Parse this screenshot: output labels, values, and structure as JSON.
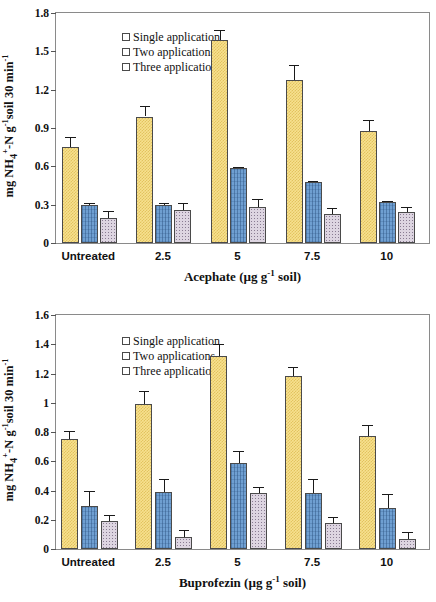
{
  "figure": {
    "panels": [
      {
        "letter": "a",
        "ylabel_html": "mg NH<sub>4</sub><sup>+</sup>-N g<sup>-1</sup>soil 30 min<sup>-1</sup>",
        "ylabel_plain": "mg NH4+-N g-1soil 30 min-1",
        "xlabel_plain": "Acephate (µg g-1 soil)"
      },
      {
        "letter": "b",
        "ylabel_plain": "mg NH4+-N g-1soil 30 min-1",
        "xlabel_plain": "Buprofezin (µg g-1 soil)"
      }
    ],
    "legend": {
      "items": [
        {
          "label": "Single application",
          "color": "#f7e08f"
        },
        {
          "label": "Two applications",
          "color": "#6f9fd1"
        },
        {
          "label": "Three applications",
          "color": "#ddd5e1"
        }
      ]
    },
    "axis_titles": {
      "y_prefix": "mg NH",
      "y_sub": "4",
      "y_sup_plus": "+",
      "y_mid": "-N g",
      "y_sup_neg1": "-1",
      "y_tail": "soil 30 min",
      "y_sup_neg1b": "-1",
      "x_unit_open": " (µg g",
      "x_unit_sup": "-1",
      "x_unit_close": " soil)",
      "x_a_name": "Acephate",
      "x_b_name": "Buprofezin"
    }
  },
  "chart_data": [
    {
      "type": "bar",
      "id": "panel-a",
      "panel_label": "a",
      "title": "",
      "xlabel": "Acephate (µg g-1 soil)",
      "ylabel": "mg NH4+-N g-1 soil 30 min-1",
      "categories": [
        "Untreated",
        "2.5",
        "5",
        "7.5",
        "10"
      ],
      "ylim": [
        0,
        1.8
      ],
      "yticks": [
        0,
        0.3,
        0.6,
        0.9,
        1.2,
        1.5,
        1.8
      ],
      "ytick_labels": [
        "0",
        "0.3",
        "0.6",
        "0.9",
        "1.2",
        "1.5",
        "1.8"
      ],
      "grid": false,
      "legend_position": "top-left",
      "series": [
        {
          "name": "Single application",
          "color": "#f7e08f",
          "values": [
            0.75,
            0.99,
            1.59,
            1.275,
            0.875
          ],
          "errors": [
            0.08,
            0.08,
            0.08,
            0.12,
            0.09
          ]
        },
        {
          "name": "Two applications",
          "color": "#6f9fd1",
          "values": [
            0.3,
            0.3,
            0.585,
            0.48,
            0.32
          ],
          "errors": [
            0.012,
            0.012,
            0.008,
            0.008,
            0.012
          ]
        },
        {
          "name": "Three applications",
          "color": "#ddd5e1",
          "values": [
            0.195,
            0.26,
            0.285,
            0.225,
            0.24
          ],
          "errors": [
            0.055,
            0.05,
            0.06,
            0.05,
            0.045
          ]
        }
      ]
    },
    {
      "type": "bar",
      "id": "panel-b",
      "panel_label": "b",
      "title": "",
      "xlabel": "Buprofezin (µg g-1 soil)",
      "ylabel": "mg NH4+-N g-1 soil 30 min-1",
      "categories": [
        "Untreated",
        "2.5",
        "5",
        "7.5",
        "10"
      ],
      "ylim": [
        0,
        1.6
      ],
      "yticks": [
        0,
        0.2,
        0.4,
        0.6,
        0.8,
        1.0,
        1.2,
        1.4,
        1.6
      ],
      "ytick_labels": [
        "0",
        "0.2",
        "0.4",
        "0.6",
        "0.8",
        "1",
        "1.2",
        "1.4",
        "1.6"
      ],
      "grid": false,
      "legend_position": "top-left",
      "series": [
        {
          "name": "Single application",
          "color": "#f7e08f",
          "values": [
            0.75,
            0.99,
            1.32,
            1.185,
            0.775
          ],
          "errors": [
            0.06,
            0.09,
            0.08,
            0.06,
            0.07
          ]
        },
        {
          "name": "Two applications",
          "color": "#6f9fd1",
          "values": [
            0.295,
            0.39,
            0.585,
            0.38,
            0.28
          ],
          "errors": [
            0.1,
            0.09,
            0.085,
            0.1,
            0.095
          ]
        },
        {
          "name": "Three applications",
          "color": "#ddd5e1",
          "values": [
            0.19,
            0.085,
            0.38,
            0.175,
            0.07
          ]
        }
      ]
    }
  ]
}
